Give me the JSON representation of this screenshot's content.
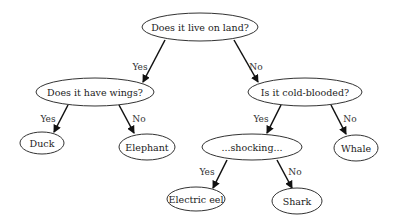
{
  "diagram": {
    "type": "decision-tree",
    "nodes": {
      "root": {
        "label": "Does it live on land?",
        "cx": 200,
        "cy": 27,
        "rx": 58,
        "ry": 14
      },
      "wings": {
        "label": "Does it have wings?",
        "cx": 95,
        "cy": 92,
        "rx": 59,
        "ry": 14
      },
      "cold": {
        "label": "Is it cold-blooded?",
        "cx": 305,
        "cy": 92,
        "rx": 57,
        "ry": 14
      },
      "duck": {
        "label": "Duck",
        "cx": 42,
        "cy": 143,
        "rx": 22,
        "ry": 11
      },
      "elephant": {
        "label": "Elephant",
        "cx": 147,
        "cy": 147,
        "rx": 28,
        "ry": 13
      },
      "shocking": {
        "label": "...shocking...",
        "cx": 252,
        "cy": 147,
        "rx": 50,
        "ry": 13
      },
      "whale": {
        "label": "Whale",
        "cx": 356,
        "cy": 148,
        "rx": 22,
        "ry": 13
      },
      "eel": {
        "label": "Electric eel",
        "cx": 196,
        "cy": 199,
        "rx": 29,
        "ry": 12
      },
      "shark": {
        "label": "Shark",
        "cx": 297,
        "cy": 201,
        "rx": 25,
        "ry": 13
      }
    },
    "edges": [
      {
        "from": "root",
        "to": "wings",
        "label": "Yes",
        "x1": 165,
        "y1": 40,
        "x2": 143,
        "y2": 82,
        "lx": 140,
        "ly": 67
      },
      {
        "from": "root",
        "to": "cold",
        "label": "No",
        "x1": 234,
        "y1": 40,
        "x2": 258,
        "y2": 82,
        "lx": 256,
        "ly": 67
      },
      {
        "from": "wings",
        "to": "duck",
        "label": "Yes",
        "x1": 68,
        "y1": 105,
        "x2": 54,
        "y2": 132,
        "lx": 48,
        "ly": 119
      },
      {
        "from": "wings",
        "to": "elephant",
        "label": "No",
        "x1": 119,
        "y1": 105,
        "x2": 134,
        "y2": 133,
        "lx": 139,
        "ly": 119
      },
      {
        "from": "cold",
        "to": "shocking",
        "label": "Yes",
        "x1": 281,
        "y1": 105,
        "x2": 267,
        "y2": 133,
        "lx": 261,
        "ly": 119
      },
      {
        "from": "cold",
        "to": "whale",
        "label": "No",
        "x1": 331,
        "y1": 105,
        "x2": 346,
        "y2": 134,
        "lx": 350,
        "ly": 119
      },
      {
        "from": "shocking",
        "to": "eel",
        "label": "Yes",
        "x1": 227,
        "y1": 160,
        "x2": 213,
        "y2": 188,
        "lx": 207,
        "ly": 172
      },
      {
        "from": "shocking",
        "to": "shark",
        "label": "No",
        "x1": 277,
        "y1": 160,
        "x2": 292,
        "y2": 188,
        "lx": 295,
        "ly": 172
      }
    ]
  }
}
